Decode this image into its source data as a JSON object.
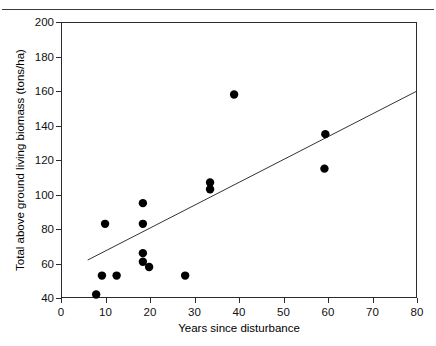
{
  "figure": {
    "caption_sliver": "",
    "x_axis_title": "Years since disturbance",
    "y_axis_title": "Total above ground living biomass (tons/ha)"
  },
  "chart_data": {
    "type": "scatter",
    "title": "",
    "xlabel": "Years since disturbance",
    "ylabel": "Total above ground living biomass (tons/ha)",
    "xlim": [
      0,
      80
    ],
    "ylim": [
      40,
      200
    ],
    "xticks": [
      0,
      10,
      20,
      30,
      40,
      50,
      60,
      70,
      80
    ],
    "yticks": [
      40,
      60,
      80,
      100,
      120,
      140,
      160,
      180,
      200
    ],
    "grid": false,
    "legend": "none",
    "marker": "filled-circle",
    "marker_color": "#000000",
    "line_color": "#333333",
    "points": [
      {
        "x": 7.9,
        "y": 42
      },
      {
        "x": 9.2,
        "y": 53
      },
      {
        "x": 9.9,
        "y": 83
      },
      {
        "x": 12.5,
        "y": 53
      },
      {
        "x": 18.4,
        "y": 95
      },
      {
        "x": 18.4,
        "y": 83
      },
      {
        "x": 18.4,
        "y": 66
      },
      {
        "x": 18.4,
        "y": 61
      },
      {
        "x": 19.8,
        "y": 58
      },
      {
        "x": 27.9,
        "y": 53
      },
      {
        "x": 33.5,
        "y": 107
      },
      {
        "x": 33.5,
        "y": 103
      },
      {
        "x": 38.9,
        "y": 158
      },
      {
        "x": 59.4,
        "y": 135
      },
      {
        "x": 59.2,
        "y": 115
      }
    ],
    "fit_line": {
      "type": "linear-regression",
      "x_start": 6.0,
      "y_start": 62.0,
      "x_end": 80.0,
      "y_end": 160.0
    }
  }
}
